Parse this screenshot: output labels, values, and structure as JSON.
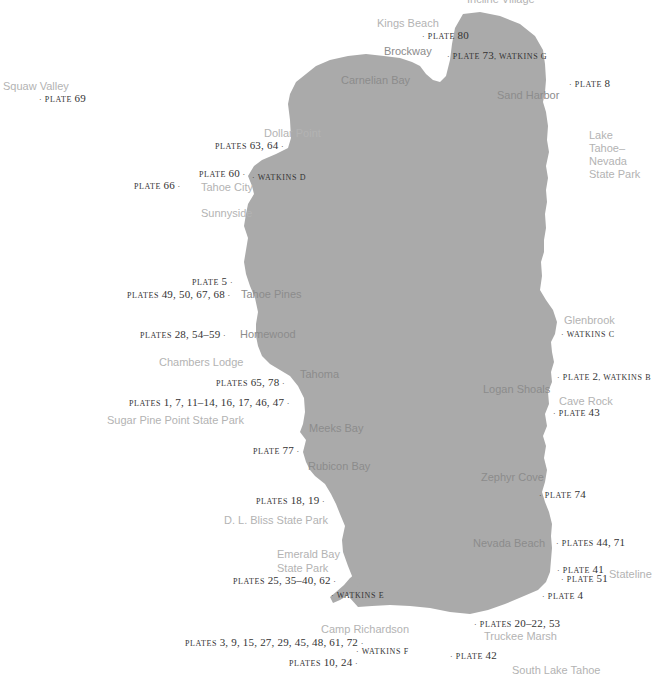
{
  "map": {
    "lake_color": "#aaaaaa",
    "place_color": "#b3b3b3",
    "place_on_lake_color": "#8c8c8c",
    "plate_color": "#333333",
    "places": [
      {
        "id": "incline-village",
        "label": "Incline Village"
      },
      {
        "id": "kings-beach",
        "label": "Kings Beach"
      },
      {
        "id": "brockway",
        "label": "Brockway"
      },
      {
        "id": "carnelian-bay",
        "label": "Carnelian Bay"
      },
      {
        "id": "sand-harbor",
        "label": "Sand Harbor"
      },
      {
        "id": "squaw-valley",
        "label": "Squaw Valley"
      },
      {
        "id": "dollar-point",
        "label": "Dollar Point"
      },
      {
        "id": "tahoe-city",
        "label": "Tahoe City"
      },
      {
        "id": "sunnyside",
        "label": "Sunnyside"
      },
      {
        "id": "lake-tahoe-nevada-state-park",
        "label": "Lake Tahoe–Nevada State Park"
      },
      {
        "id": "tahoe-pines",
        "label": "Tahoe Pines"
      },
      {
        "id": "homewood",
        "label": "Homewood"
      },
      {
        "id": "chambers-lodge",
        "label": "Chambers Lodge"
      },
      {
        "id": "tahoma",
        "label": "Tahoma"
      },
      {
        "id": "sugar-pine-point",
        "label": "Sugar Pine Point State Park"
      },
      {
        "id": "meeks-bay",
        "label": "Meeks Bay"
      },
      {
        "id": "rubicon-bay",
        "label": "Rubicon Bay"
      },
      {
        "id": "dl-bliss",
        "label": "D. L. Bliss State Park"
      },
      {
        "id": "emerald-bay-1",
        "label": "Emerald Bay"
      },
      {
        "id": "emerald-bay-2",
        "label": "State Park"
      },
      {
        "id": "camp-richardson",
        "label": "Camp Richardson"
      },
      {
        "id": "glenbrook",
        "label": "Glenbrook"
      },
      {
        "id": "logan-shoals",
        "label": "Logan Shoals"
      },
      {
        "id": "cave-rock",
        "label": "Cave Rock"
      },
      {
        "id": "zephyr-cove",
        "label": "Zephyr Cove"
      },
      {
        "id": "nevada-beach",
        "label": "Nevada Beach"
      },
      {
        "id": "stateline",
        "label": "Stateline"
      },
      {
        "id": "truckee-marsh",
        "label": "Truckee Marsh"
      },
      {
        "id": "south-lake-tahoe",
        "label": "South Lake Tahoe"
      }
    ],
    "plates": [
      {
        "id": "p80",
        "label": "· plate 80"
      },
      {
        "id": "p73",
        "label": "· plate 73, watkins g"
      },
      {
        "id": "p8",
        "label": "· plate 8"
      },
      {
        "id": "p69",
        "label": "· plate 69"
      },
      {
        "id": "p63",
        "label": "plates 63, 64 ·"
      },
      {
        "id": "p60",
        "label": "plate 60 ·"
      },
      {
        "id": "wd",
        "label": "· watkins d"
      },
      {
        "id": "p66",
        "label": "plate 66 ·"
      },
      {
        "id": "p5",
        "label": "plate 5 ·"
      },
      {
        "id": "p49",
        "label": "plates 49, 50, 67, 68 ·"
      },
      {
        "id": "p28",
        "label": "plates 28, 54–59 ·"
      },
      {
        "id": "p65",
        "label": "plates 65, 78 ·"
      },
      {
        "id": "p1",
        "label": "plates 1, 7, 11–14, 16, 17, 46, 47 ·"
      },
      {
        "id": "p77",
        "label": "plate 77 ·"
      },
      {
        "id": "p18",
        "label": "plates 18, 19 ·"
      },
      {
        "id": "p25",
        "label": "plates 25, 35–40, 62 ·"
      },
      {
        "id": "we",
        "label": "· watkins e"
      },
      {
        "id": "p3",
        "label": "plates 3, 9, 15, 27, 29, 45, 48, 61, 72 ·"
      },
      {
        "id": "wf",
        "label": "· watkins f"
      },
      {
        "id": "p10",
        "label": "plates 10, 24 ·"
      },
      {
        "id": "wc",
        "label": "· watkins c"
      },
      {
        "id": "p2",
        "label": "· plate 2, watkins b"
      },
      {
        "id": "p43",
        "label": "· plate 43"
      },
      {
        "id": "p74",
        "label": "· plate 74"
      },
      {
        "id": "p44",
        "label": "· plates 44, 71"
      },
      {
        "id": "p41",
        "label": "· plate 41"
      },
      {
        "id": "p51",
        "label": "· plate 51"
      },
      {
        "id": "p4",
        "label": "· plate 4"
      },
      {
        "id": "p20",
        "label": "· plates 20–22, 53"
      },
      {
        "id": "p42",
        "label": "· plate 42"
      }
    ]
  }
}
